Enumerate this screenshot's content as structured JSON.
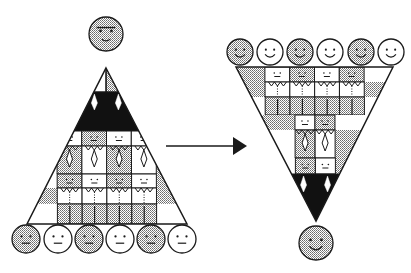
{
  "colors": {
    "background": "#ffffff",
    "line": "#1a1a1a",
    "gray": "#b8b8b8",
    "white": "#ffffff",
    "black": "#111111"
  },
  "arrow": {
    "from": [
      166,
      146
    ],
    "to": [
      247,
      146
    ],
    "meaning": "transforms into"
  },
  "left_pyramid": {
    "orientation": "upright",
    "apex": [
      106,
      68
    ],
    "base_y": 224,
    "base_left": 27,
    "base_right": 187,
    "leader": {
      "cx": 106,
      "cy": 34,
      "r": 17,
      "fill": "gray",
      "expression": "stern"
    },
    "bands": [
      {
        "y0": 68,
        "y1": 92,
        "role": "leader-head",
        "cells": [
          "white",
          "gray"
        ]
      },
      {
        "y0": 92,
        "y1": 131,
        "role": "leader-body",
        "cells": [
          "black"
        ]
      },
      {
        "y0": 131,
        "y1": 146,
        "role": "managers-head",
        "cells": [
          "white",
          "gray",
          "white",
          "white"
        ]
      },
      {
        "y0": 146,
        "y1": 174,
        "role": "managers-body",
        "cells": [
          "gray",
          "white",
          "gray",
          "white"
        ]
      },
      {
        "y0": 174,
        "y1": 188,
        "role": "staff-head",
        "cells": [
          "gray",
          "white",
          "gray",
          "white"
        ]
      },
      {
        "y0": 188,
        "y1": 204,
        "role": "staff-body",
        "cells": [
          "white",
          "white",
          "white",
          "white"
        ]
      },
      {
        "y0": 204,
        "y1": 224,
        "role": "base",
        "cells": [
          "gray",
          "gray",
          "gray",
          "gray"
        ]
      }
    ],
    "people": [
      {
        "cx": 26,
        "cy": 239,
        "fill": "gray",
        "expression": "neutral"
      },
      {
        "cx": 58,
        "cy": 239,
        "fill": "white",
        "expression": "neutral"
      },
      {
        "cx": 89,
        "cy": 239,
        "fill": "gray",
        "expression": "neutral"
      },
      {
        "cx": 120,
        "cy": 239,
        "fill": "white",
        "expression": "neutral"
      },
      {
        "cx": 151,
        "cy": 239,
        "fill": "gray",
        "expression": "neutral"
      },
      {
        "cx": 182,
        "cy": 239,
        "fill": "white",
        "expression": "neutral"
      }
    ]
  },
  "right_pyramid": {
    "orientation": "inverted",
    "apex": [
      316,
      221
    ],
    "top_y": 67,
    "top_left": 236,
    "top_right": 393,
    "leader": {
      "cx": 316,
      "cy": 243,
      "r": 17,
      "fill": "gray",
      "expression": "smiling"
    },
    "bands": [
      {
        "y0": 67,
        "y1": 82,
        "role": "staff-head",
        "cells": [
          "white",
          "gray",
          "white",
          "gray"
        ]
      },
      {
        "y0": 82,
        "y1": 97,
        "role": "staff-body",
        "cells": [
          "white",
          "white",
          "white",
          "white"
        ]
      },
      {
        "y0": 97,
        "y1": 115,
        "role": "base",
        "cells": [
          "gray",
          "gray",
          "gray",
          "gray"
        ]
      },
      {
        "y0": 115,
        "y1": 130,
        "role": "managers-head",
        "cells": [
          "white",
          "gray"
        ]
      },
      {
        "y0": 130,
        "y1": 158,
        "role": "managers-body",
        "cells": [
          "gray",
          "white"
        ]
      },
      {
        "y0": 158,
        "y1": 174,
        "role": "supervisor-head",
        "cells": [
          "gray",
          "white"
        ]
      },
      {
        "y0": 174,
        "y1": 221,
        "role": "leader-body",
        "cells": [
          "black"
        ]
      }
    ],
    "people": [
      {
        "cx": 240,
        "cy": 52,
        "fill": "gray",
        "expression": "smiling"
      },
      {
        "cx": 270,
        "cy": 52,
        "fill": "white",
        "expression": "smiling"
      },
      {
        "cx": 300,
        "cy": 52,
        "fill": "gray",
        "expression": "smiling"
      },
      {
        "cx": 330,
        "cy": 52,
        "fill": "white",
        "expression": "smiling"
      },
      {
        "cx": 361,
        "cy": 52,
        "fill": "gray",
        "expression": "smiling"
      },
      {
        "cx": 391,
        "cy": 52,
        "fill": "white",
        "expression": "smiling"
      }
    ]
  }
}
